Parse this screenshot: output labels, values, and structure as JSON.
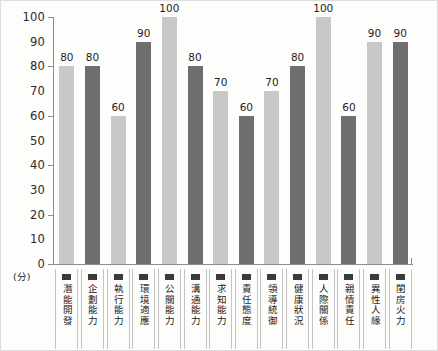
{
  "chart_data": {
    "type": "bar",
    "title": "",
    "xlabel": "",
    "ylabel": "(分)",
    "ylim": [
      0,
      100
    ],
    "ytick_step": 10,
    "grid": false,
    "legend": "none",
    "value_labels": true,
    "categories": [
      "潛能開發",
      "企劃能力",
      "執行能力",
      "環境適應",
      "公關能力",
      "溝通能力",
      "求知能力",
      "責任態度",
      "領導統御",
      "健康狀況",
      "人際關係",
      "親情責任",
      "異性人緣",
      "閨房火力"
    ],
    "values": [
      80,
      80,
      60,
      90,
      100,
      80,
      70,
      60,
      70,
      80,
      100,
      60,
      90,
      90
    ],
    "bar_colors": [
      "#c8c8c6",
      "#6f6f6f",
      "#c8c8c6",
      "#6f6f6f",
      "#c8c8c6",
      "#6f6f6f",
      "#c8c8c6",
      "#6f6f6f",
      "#c8c8c6",
      "#6f6f6f",
      "#c8c8c6",
      "#6f6f6f",
      "#c8c8c6",
      "#6f6f6f"
    ],
    "yticks": [
      0,
      10,
      20,
      30,
      40,
      50,
      60,
      70,
      80,
      90,
      100
    ],
    "ytick_labels": [
      "0",
      "10",
      "20",
      "30",
      "40",
      "50",
      "60",
      "70",
      "80",
      "90",
      "100"
    ],
    "major_ticks": [
      0,
      20,
      40,
      60,
      80,
      100
    ],
    "axis_color": "#8d8d8d",
    "text_color": "#1d1d1d",
    "background": "#fdfdfc"
  }
}
